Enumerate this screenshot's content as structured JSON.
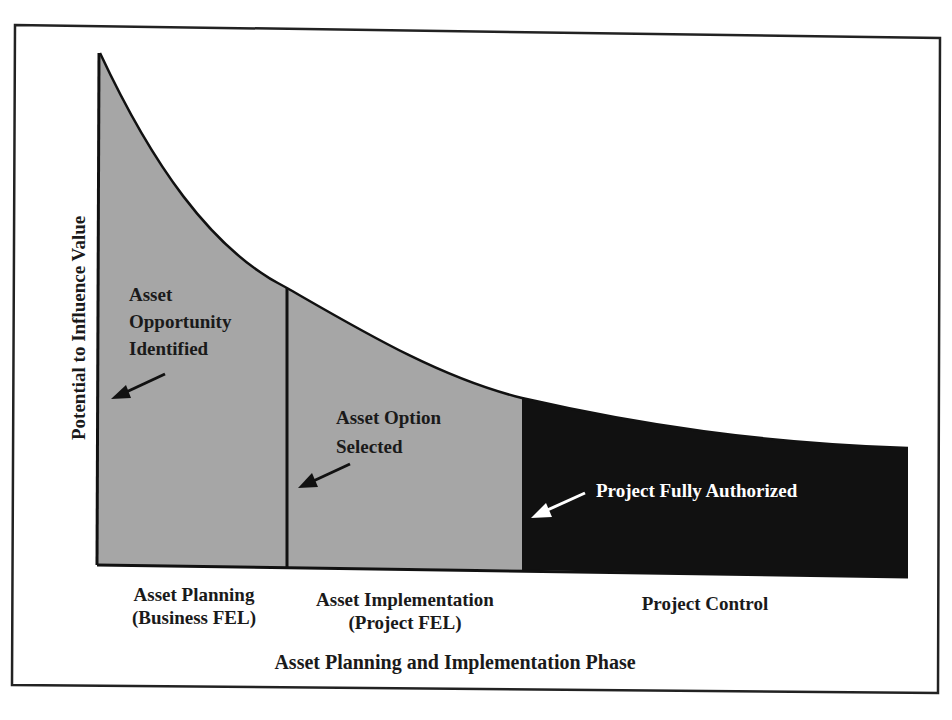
{
  "diagram": {
    "y_axis_label": "Potential to Influence Value",
    "x_axis_title": "Asset Planning and Implementation Phase",
    "phases": [
      {
        "label_line1": "Asset Planning",
        "label_line2": "(Business FEL)",
        "fill": "#a6a6a6"
      },
      {
        "label_line1": "Asset Implementation",
        "label_line2": "(Project FEL)",
        "fill": "#a6a6a6"
      },
      {
        "label_line1": "Project Control",
        "label_line2": "",
        "fill": "#111111"
      }
    ],
    "milestones": [
      {
        "line1": "Asset",
        "line2": "Opportunity",
        "line3": "Identified"
      },
      {
        "line1": "Asset Option",
        "line2": "Selected"
      },
      {
        "line1": "Project Fully Authorized"
      }
    ],
    "colors": {
      "frame": "#222222",
      "grey_fill": "#a6a6a6",
      "black_fill": "#111111",
      "curve": "#111111",
      "white_annotation": "#ffffff"
    }
  }
}
